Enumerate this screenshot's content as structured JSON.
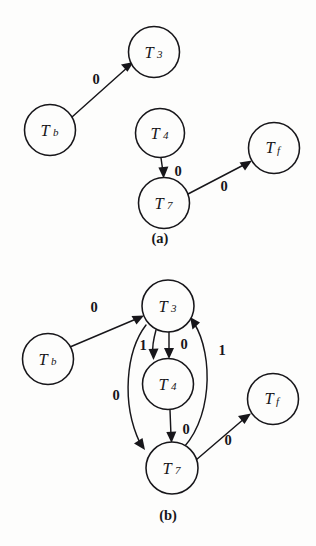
{
  "page": {
    "background_color": "#fdfdfc",
    "ink_color": "#17161a",
    "width": 316,
    "height": 546
  },
  "figures": [
    {
      "id": "a",
      "caption": "(a)",
      "caption_pos": {
        "x": 160,
        "y": 238
      },
      "nodes": [
        {
          "id": "Tb",
          "base": "T",
          "sub": "b",
          "cx": 50,
          "cy": 130,
          "r": 25.5
        },
        {
          "id": "T3",
          "base": "T",
          "sub": "3",
          "cx": 154,
          "cy": 52,
          "r": 25.5
        },
        {
          "id": "T4",
          "base": "T",
          "sub": "4",
          "cx": 160,
          "cy": 133,
          "r": 24.5
        },
        {
          "id": "T7",
          "base": "T",
          "sub": "7",
          "cx": 164,
          "cy": 203,
          "r": 25.5
        },
        {
          "id": "Tf",
          "base": "T",
          "sub": "f",
          "cx": 274,
          "cy": 148,
          "r": 25.5
        }
      ],
      "edges": [
        {
          "from": "Tb",
          "to": "T3",
          "label": "0",
          "label_pos": {
            "x": 96,
            "y": 79
          },
          "kind": "straight"
        },
        {
          "from": "T4",
          "to": "T7",
          "label": "0",
          "label_pos": {
            "x": 178,
            "y": 171
          },
          "kind": "straight"
        },
        {
          "from": "T7",
          "to": "Tf",
          "label": "0",
          "label_pos": {
            "x": 224,
            "y": 186
          },
          "kind": "straight"
        }
      ]
    },
    {
      "id": "b",
      "caption": "(b)",
      "caption_pos": {
        "x": 168,
        "y": 242
      },
      "nodes": [
        {
          "id": "Tb",
          "base": "T",
          "sub": "b",
          "cx": 48,
          "cy": 86,
          "r": 25.5
        },
        {
          "id": "T3",
          "base": "T",
          "sub": "3",
          "cx": 168,
          "cy": 33,
          "r": 26.0
        },
        {
          "id": "T4",
          "base": "T",
          "sub": "4",
          "cx": 168,
          "cy": 111,
          "r": 25.5
        },
        {
          "id": "T7",
          "base": "T",
          "sub": "7",
          "cx": 172,
          "cy": 195,
          "r": 26.0
        },
        {
          "id": "Tf",
          "base": "T",
          "sub": "f",
          "cx": 273,
          "cy": 126,
          "r": 25.5
        }
      ],
      "edges": [
        {
          "from": "Tb",
          "to": "T3",
          "label": "0",
          "label_pos": {
            "x": 94,
            "y": 34
          },
          "kind": "straight"
        },
        {
          "from": "T3",
          "to": "T4",
          "label": "1",
          "label_pos": {
            "x": 145,
            "y": 74
          },
          "kind": "straight-left"
        },
        {
          "from": "T3",
          "to": "T4",
          "label": "0",
          "label_pos": {
            "x": 184,
            "y": 71
          },
          "kind": "straight-right"
        },
        {
          "from": "T3",
          "to": "T7",
          "label": "0",
          "label_pos": {
            "x": 116,
            "y": 122
          },
          "kind": "curve-left"
        },
        {
          "from": "T4",
          "to": "T7",
          "label": "0",
          "label_pos": {
            "x": 186,
            "y": 156
          },
          "kind": "straight"
        },
        {
          "from": "T7",
          "to": "T3",
          "label": "1",
          "label_pos": {
            "x": 222,
            "y": 77
          },
          "kind": "curve-right"
        },
        {
          "from": "T7",
          "to": "Tf",
          "label": "0",
          "label_pos": {
            "x": 228,
            "y": 167
          },
          "kind": "straight"
        }
      ]
    }
  ]
}
